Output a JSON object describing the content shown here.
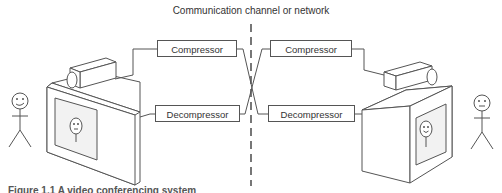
{
  "diagram": {
    "title": "Communication channel or network",
    "left": {
      "compressor_label": "Compressor",
      "decompressor_label": "Decompressor"
    },
    "right": {
      "compressor_label": "Compressor",
      "decompressor_label": "Decompressor"
    },
    "caption": "Figure 1.1  A video conferencing system"
  },
  "colors": {
    "line": "#555555",
    "text": "#333333",
    "screen_fill": "#f2f2f2"
  }
}
